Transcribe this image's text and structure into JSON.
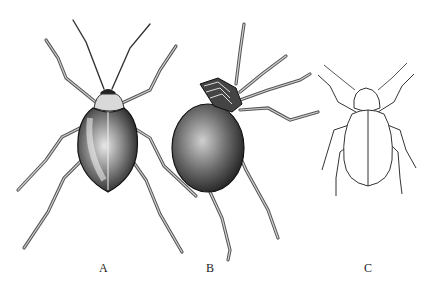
{
  "figure": {
    "panels": [
      {
        "id": "A",
        "label": "A",
        "description": "Dark-shelled beetle, dorsal view, shaded stipple drawing"
      },
      {
        "id": "B",
        "label": "B",
        "description": "Rounded, globose beetle, oblique view with head tucked, shaded stipple drawing"
      },
      {
        "id": "C",
        "label": "C",
        "description": "Beetle outline line drawing, dorsal view"
      }
    ]
  }
}
